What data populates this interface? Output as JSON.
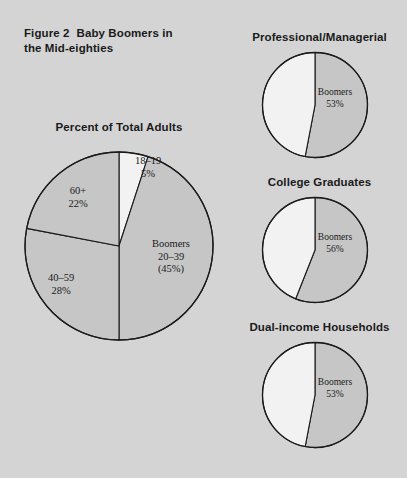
{
  "figure": {
    "number_label": "Figure 2",
    "title": "Baby Boomers in the Mid-eighties",
    "title_line1": "Baby Boomers in",
    "title_line2": "the Mid-eighties"
  },
  "colors": {
    "background": "#d4d4d4",
    "slice_gray": "#c6c6c6",
    "slice_white": "#f2f2f2",
    "outline": "#1a1a1a",
    "text": "#1a1a1a"
  },
  "main_chart": {
    "title": "Percent of Total Adults",
    "labels": {
      "teens": "18–19",
      "teens_pct": "5%",
      "seniors": "60+",
      "seniors_pct": "22%",
      "midlife": "40–59",
      "midlife_pct": "28%",
      "boomers": "Boomers",
      "boomers_range": "20–39",
      "boomers_pct": "(45%)"
    }
  },
  "small_charts": [
    {
      "title": "Professional/Managerial",
      "series_label": "Boomers",
      "value_label": "53%",
      "boomers_pct": 53,
      "other_pct": 47
    },
    {
      "title": "College Graduates",
      "series_label": "Boomers",
      "value_label": "56%",
      "boomers_pct": 56,
      "other_pct": 44
    },
    {
      "title": "Dual-income Households",
      "series_label": "Boomers",
      "value_label": "53%",
      "boomers_pct": 53,
      "other_pct": 47
    }
  ],
  "chart_data": [
    {
      "type": "pie",
      "title": "Percent of Total Adults",
      "categories": [
        "18–19",
        "Boomers 20–39",
        "40–59",
        "60+"
      ],
      "values": [
        5,
        45,
        28,
        22
      ],
      "value_labels": [
        "5%",
        "(45%)",
        "28%",
        "22%"
      ],
      "slice_colors": [
        "#f2f2f2",
        "#c6c6c6",
        "#c6c6c6",
        "#c6c6c6"
      ],
      "start_angle_deg": 0,
      "direction": "clockwise",
      "legend": "none",
      "xlabel": "",
      "ylabel": ""
    },
    {
      "type": "pie",
      "title": "Professional/Managerial",
      "categories": [
        "Boomers",
        "Other"
      ],
      "values": [
        53,
        47
      ],
      "value_labels": [
        "53%",
        ""
      ],
      "slice_colors": [
        "#c6c6c6",
        "#f2f2f2"
      ],
      "start_angle_deg": 0,
      "direction": "clockwise",
      "legend": "none"
    },
    {
      "type": "pie",
      "title": "College Graduates",
      "categories": [
        "Boomers",
        "Other"
      ],
      "values": [
        56,
        44
      ],
      "value_labels": [
        "56%",
        ""
      ],
      "slice_colors": [
        "#c6c6c6",
        "#f2f2f2"
      ],
      "start_angle_deg": 0,
      "direction": "clockwise",
      "legend": "none"
    },
    {
      "type": "pie",
      "title": "Dual-income Households",
      "categories": [
        "Boomers",
        "Other"
      ],
      "values": [
        53,
        47
      ],
      "value_labels": [
        "53%",
        ""
      ],
      "slice_colors": [
        "#c6c6c6",
        "#f2f2f2"
      ],
      "start_angle_deg": 0,
      "direction": "clockwise",
      "legend": "none"
    }
  ]
}
